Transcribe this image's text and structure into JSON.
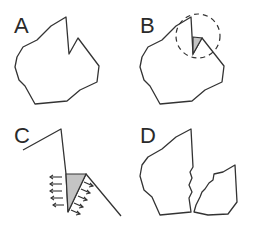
{
  "panels": [
    {
      "id": "A",
      "label": "A",
      "description": "Polygon with a notch"
    },
    {
      "id": "B",
      "label": "B",
      "description": "Polygon with notch highlighted by dashed circle and shaded wedge"
    },
    {
      "id": "C",
      "label": "C",
      "description": "Close-up of notch with shaded wedge and outward-pointing force arrows"
    },
    {
      "id": "D",
      "label": "D",
      "description": "Polygon fractured into two pieces along a jagged crack"
    }
  ],
  "colors": {
    "stroke": "#333333",
    "wedge_fill": "#c4c4c4",
    "background": "#ffffff"
  }
}
